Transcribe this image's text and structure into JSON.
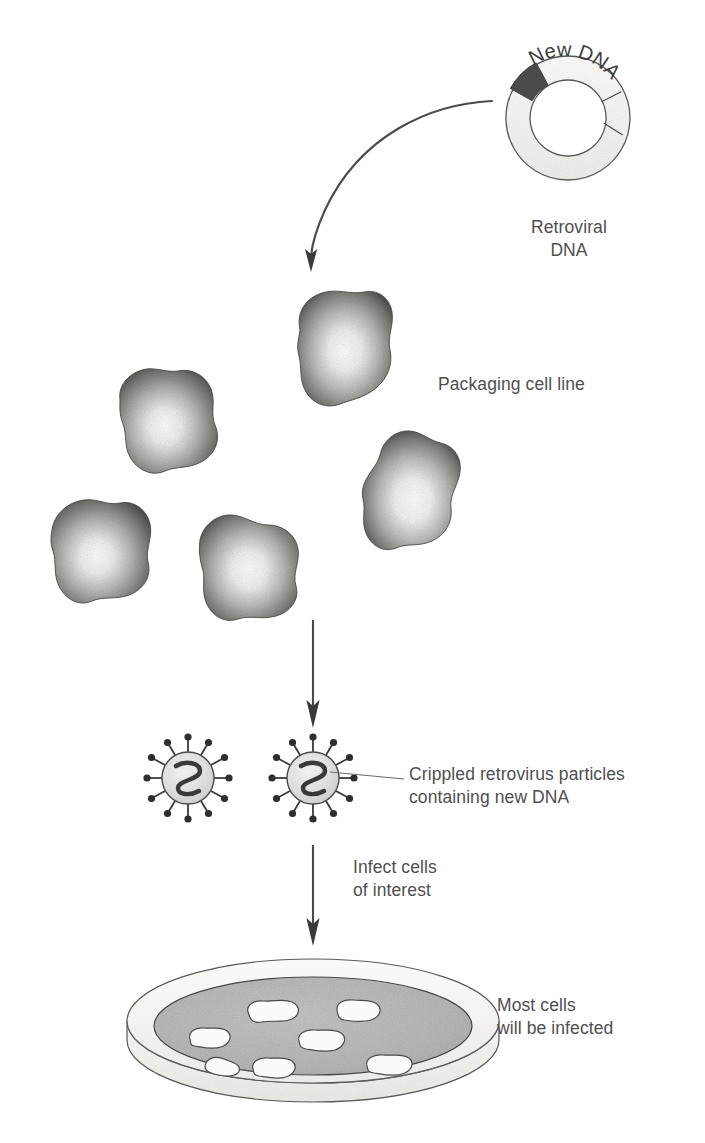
{
  "diagram": {
    "labels": {
      "new_dna": "New DNA",
      "retroviral_dna_line1": "Retroviral",
      "retroviral_dna_line2": "DNA",
      "packaging_cell_line": "Packaging cell line",
      "crippled_line1": "Crippled retrovirus particles",
      "crippled_line2": "containing new DNA",
      "infect_line1": "Infect cells",
      "infect_line2": "of interest",
      "most_cells_line1": "Most cells",
      "most_cells_line2": "will be infected"
    },
    "icons": {
      "plasmid": "plasmid-ring-icon",
      "curved_arrow": "curved-arrow-icon",
      "down_arrow": "down-arrow-icon",
      "cell": "cell-blob-icon",
      "virus": "retrovirus-particle-icon",
      "petri_dish": "petri-dish-icon",
      "leader_line": "leader-line-icon"
    },
    "colors": {
      "ink": "#3a3a3a",
      "text": "#4f4f4f",
      "ring_fill": "#f4f3f1",
      "ring_dark_segment": "#4a4a4a",
      "cell_center": "#fbfbfa",
      "cell_edge": "#545454",
      "virus_fill": "#e2e2e0",
      "dish_rim": "#f2f1ef",
      "dish_medium": "#b9b8b5",
      "dish_cell": "#fbfbfa"
    },
    "counts": {
      "packaging_cells": 5,
      "virus_particles": 2,
      "virus_spikes": 12,
      "dish_cells": 7
    }
  }
}
